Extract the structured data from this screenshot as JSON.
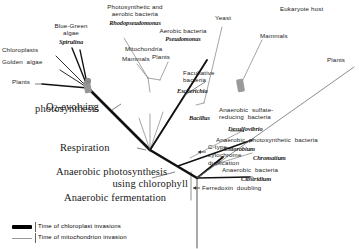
{
  "labels": {
    "photosynthetic_aerobic_bacteria": "Photosynthetic and\naerobic bacteria",
    "rhodopseudomonas": "Rhodopseudomonas",
    "aerobic_bacteria": "Aerobic bacteria",
    "pseudomonas": "Pseudomonas",
    "mitochondria": "Mitochondria",
    "mitochondria_mammals": "Mammals",
    "mitochondria_plants": "Plants",
    "yeast": "Yeast",
    "eukaryote_host": "Eukaryote host",
    "host_mammals": "Mammals",
    "host_plants": "Plants",
    "blue_green_algae": "Blue-Green\nalgae",
    "spirulina": "Spirulina",
    "chloroplasts": "Chloroplasts",
    "golden_algae": "Golden  algae",
    "chloroplast_plants": "Plants",
    "facultative_bacteria": "Facultative\nbacteria",
    "escherichia": "Escherichia",
    "bacillus": "Bacillus",
    "anaerobic_sulfate_reducing": "Anaerobic  sulfate-\nreducing  bacteria",
    "desulfovibrio": "Desulfovibrio",
    "anaerobic_photosynthetic_bacteria": "Anaerobic  photosynthetic  bacteria",
    "chlorobium": "Chlorobium",
    "chromatium": "Chromatium",
    "anaerobic_bacteria": "Anaerobic  bacteria",
    "clostridium": "Clostridium",
    "c_type_cytochrome": "C-type\ncytochrome\nduplication",
    "ferredoxin_doubling": "Ferredoxin  doubling",
    "o2_evolving_photosynthesis_line1": "O",
    "o2_evolving_photosynthesis_sub": "2",
    "o2_evolving_photosynthesis_line1b": "-evolving",
    "o2_evolving_photosynthesis_line2": "photosynthesis",
    "respiration": "Respiration",
    "anaerobic_photosynthesis_line1": "Anaerobic photosynthesis",
    "anaerobic_photosynthesis_line2": "using chlorophyll",
    "anaerobic_fermentation": "Anaerobic fermentation"
  },
  "legend": {
    "chloroplast": "Time  of  chloroplast  invasions",
    "mitochondrion": "Time  of  mitochondrion  invasion"
  },
  "colors": {
    "ink": "#1a1a1a",
    "thick_branch": "#111111",
    "thin_branch": "#7d7d7d",
    "invasion_marker": "#8c8c8c",
    "background": "#ffffff"
  }
}
